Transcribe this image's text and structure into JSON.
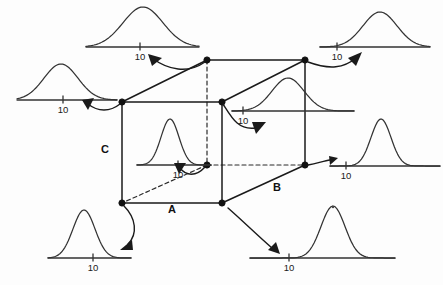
{
  "figure": {
    "background_color": "#fdfdfd",
    "line_color": "#1a1a1a",
    "curve_color": "#333333",
    "width": 443,
    "height": 285
  },
  "factor_labels": [
    {
      "id": "factor-a",
      "text": "A",
      "x": 172,
      "y": 213
    },
    {
      "id": "factor-b",
      "text": "B",
      "x": 277,
      "y": 191
    },
    {
      "id": "factor-c",
      "text": "C",
      "x": 105,
      "y": 153
    }
  ],
  "cube": {
    "vertices": [
      {
        "id": "front-bottom-left",
        "x": 122,
        "y": 203,
        "label": "(-,-,-)"
      },
      {
        "id": "front-bottom-right",
        "x": 222,
        "y": 203,
        "label": "(+,-,-)"
      },
      {
        "id": "front-top-left",
        "x": 122,
        "y": 102,
        "label": "(-,-,+)"
      },
      {
        "id": "front-top-right",
        "x": 222,
        "y": 102,
        "label": "(+,-,+)"
      },
      {
        "id": "back-bottom-left",
        "x": 207,
        "y": 165,
        "label": "(-,+,-)"
      },
      {
        "id": "back-bottom-right",
        "x": 305,
        "y": 165,
        "label": "(+,+,-)"
      },
      {
        "id": "back-top-left",
        "x": 207,
        "y": 60,
        "label": "(-,+,+)"
      },
      {
        "id": "back-top-right",
        "x": 305,
        "y": 60,
        "label": "(+,+,+)"
      }
    ],
    "solid_edges": [
      {
        "from": "front-bottom-left",
        "to": "front-bottom-right"
      },
      {
        "from": "front-bottom-left",
        "to": "front-top-left"
      },
      {
        "from": "front-top-left",
        "to": "front-top-right"
      },
      {
        "from": "front-top-right",
        "to": "front-bottom-right"
      },
      {
        "from": "front-top-left",
        "to": "back-top-left"
      },
      {
        "from": "front-top-right",
        "to": "back-top-right"
      },
      {
        "from": "back-top-left",
        "to": "back-top-right"
      },
      {
        "from": "back-top-right",
        "to": "back-bottom-right"
      },
      {
        "from": "front-bottom-right",
        "to": "back-bottom-right"
      }
    ],
    "dashed_edges": [
      {
        "from": "back-top-left",
        "to": "back-bottom-left"
      },
      {
        "from": "back-bottom-left",
        "to": "back-bottom-right"
      },
      {
        "from": "back-bottom-left",
        "to": "front-bottom-left"
      }
    ]
  },
  "chart_data": {
    "type": "line",
    "xlabel": "Response",
    "ylabel": "Density",
    "tick_label": "10",
    "note": "Each panel shows a normal density curve on a horizontal response axis with a single tick labelled 10. center_offset is the curve mean measured in pixels relative to the tick; spread is the curve standard deviation in pixels; height is the peak height in pixels.",
    "distributions": [
      {
        "id": "dist-top-left",
        "vertex": "back-top-left",
        "tick_label": "10",
        "axis": {
          "x": 86,
          "y": 47,
          "width": 113
        },
        "tick_x": 140,
        "center_offset": 3,
        "spread": 20,
        "height": 40,
        "shape": "broad",
        "description": "wide flat distribution centered near 10"
      },
      {
        "id": "dist-top-right",
        "vertex": "back-top-right",
        "tick_label": "10",
        "axis": {
          "x": 320,
          "y": 47,
          "width": 110
        },
        "tick_x": 337,
        "center_offset": 43,
        "spread": 17,
        "height": 35,
        "shape": "broad-shifted",
        "description": "wide distribution shifted well above 10"
      },
      {
        "id": "dist-left-middle",
        "vertex": "front-top-left",
        "tick_label": "10",
        "axis": {
          "x": 17,
          "y": 100,
          "width": 100
        },
        "tick_x": 63,
        "center_offset": -2,
        "spread": 17,
        "height": 36,
        "shape": "broad",
        "description": "wide distribution centered near 10"
      },
      {
        "id": "dist-center-right",
        "vertex": "front-top-right",
        "tick_label": "10",
        "axis": {
          "x": 232,
          "y": 111,
          "width": 122
        },
        "tick_x": 243,
        "center_offset": 45,
        "spread": 16,
        "height": 33,
        "shape": "broad-shifted",
        "description": "wide distribution shifted above 10"
      },
      {
        "id": "dist-inner",
        "vertex": "back-bottom-left",
        "tick_label": "10",
        "axis": {
          "x": 137,
          "y": 165,
          "width": 74
        },
        "tick_x": 178,
        "center_offset": -8,
        "spread": 9,
        "height": 46,
        "shape": "narrow",
        "description": "narrow tall distribution centered near 10"
      },
      {
        "id": "dist-right-middle",
        "vertex": "back-bottom-right",
        "tick_label": "10",
        "axis": {
          "x": 330,
          "y": 166,
          "width": 110
        },
        "tick_x": 346,
        "center_offset": 35,
        "spread": 10,
        "height": 47,
        "shape": "narrow-shifted",
        "description": "narrow tall distribution shifted above 10"
      },
      {
        "id": "dist-bottom-left",
        "vertex": "front-bottom-left",
        "tick_label": "10",
        "axis": {
          "x": 48,
          "y": 258,
          "width": 83
        },
        "tick_x": 93,
        "center_offset": -9,
        "spread": 11,
        "height": 48,
        "shape": "narrow",
        "description": "narrow distribution centered near 10"
      },
      {
        "id": "dist-bottom-right",
        "vertex": "front-bottom-right",
        "tick_label": "10",
        "axis": {
          "x": 250,
          "y": 258,
          "width": 145
        },
        "tick_x": 289,
        "center_offset": 44,
        "spread": 12,
        "height": 52,
        "shape": "narrow-shifted",
        "description": "narrow distribution shifted above 10"
      }
    ]
  },
  "arrows": [
    {
      "id": "arrow-to-top-left",
      "from_vertex": "back-top-left",
      "to_dist": "dist-top-left",
      "path": "M 205,62 C 188,74 168,70 152,58",
      "head": [
        148,
        54,
        162,
        58,
        152,
        66
      ]
    },
    {
      "id": "arrow-to-top-right",
      "from_vertex": "back-top-right",
      "to_dist": "dist-top-right",
      "path": "M 308,62 C 330,70 344,68 356,58",
      "head": [
        362,
        52,
        356,
        66,
        348,
        58
      ]
    },
    {
      "id": "arrow-to-left-middle",
      "from_vertex": "front-top-left",
      "to_dist": "dist-left-middle",
      "path": "M 120,104 C 110,112 98,112 88,104",
      "head": [
        82,
        100,
        94,
        98,
        88,
        110
      ]
    },
    {
      "id": "arrow-to-center-right",
      "from_vertex": "front-top-right",
      "to_dist": "dist-center-right",
      "path": "M 223,104 C 232,118 238,130 255,128",
      "head": [
        266,
        122,
        256,
        134,
        252,
        122
      ]
    },
    {
      "id": "arrow-to-inner",
      "from_vertex": "back-bottom-left",
      "to_dist": "dist-inner",
      "path": "M 205,167 C 196,177 186,176 180,168",
      "head": [
        174,
        163,
        186,
        163,
        179,
        174
      ]
    },
    {
      "id": "arrow-to-right-middle",
      "from_vertex": "back-bottom-right",
      "to_dist": "dist-right-middle",
      "path": "M 308,165 C 318,163 324,161 330,160",
      "head": [
        338,
        158,
        330,
        165,
        329,
        156
      ]
    },
    {
      "id": "arrow-to-bottom-left",
      "from_vertex": "front-bottom-left",
      "to_dist": "dist-bottom-left",
      "path": "M 124,206 C 136,218 138,234 128,244",
      "head": [
        120,
        250,
        132,
        240,
        133,
        250
      ]
    },
    {
      "id": "arrow-to-bottom-right",
      "from_vertex": "front-bottom-right",
      "to_dist": "dist-bottom-right",
      "path": "M 228,208 C 244,222 258,236 272,248",
      "head": [
        280,
        254,
        268,
        250,
        276,
        242
      ]
    }
  ],
  "specks": [
    {
      "id": "speck-bottom-right",
      "x": 333,
      "y": 207,
      "r": 1.2
    }
  ]
}
